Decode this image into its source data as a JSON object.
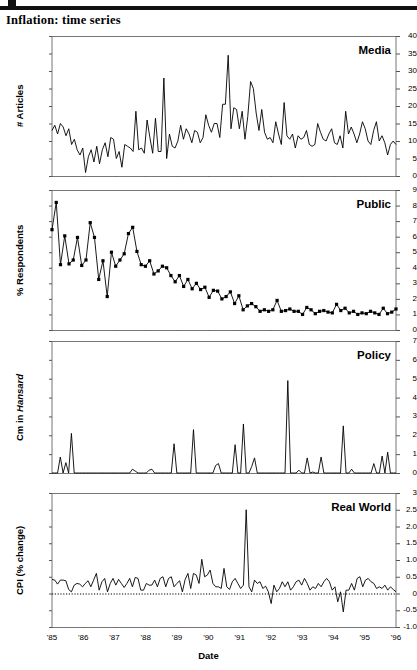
{
  "page": {
    "title": "Inflation: time series",
    "xlabel": "Date"
  },
  "chart_data": [
    {
      "id": "media",
      "type": "line",
      "title": "Media",
      "ylabel": "# Articles",
      "xlabel": "Date",
      "ylim": [
        0,
        40
      ],
      "yticks": [
        0,
        5,
        10,
        15,
        20,
        25,
        30,
        35,
        40
      ],
      "yticklabels": [
        "0",
        "5",
        "10",
        "15",
        "20",
        "25",
        "30",
        "35",
        "40"
      ],
      "xlim": [
        "'85",
        "'96"
      ],
      "xticklabels": [
        "'85",
        "'86",
        "'87",
        "'88",
        "'89",
        "'90",
        "'91",
        "'92",
        "'93",
        "'94",
        "'95",
        "'96"
      ],
      "grid": false,
      "marker": "none",
      "values": [
        13,
        14.5,
        12,
        15,
        14,
        11.5,
        13.5,
        9,
        10.5,
        7.5,
        6,
        8,
        1,
        5.5,
        7.5,
        4,
        8.5,
        3.5,
        7.5,
        9.5,
        5.5,
        11,
        10.5,
        5,
        7,
        2.5,
        9,
        8.5,
        8,
        7,
        18.5,
        7.5,
        8,
        6.5,
        16,
        11,
        6.5,
        16.5,
        7,
        7,
        28,
        5,
        12,
        8.5,
        8,
        10,
        14.5,
        10.5,
        13.5,
        12,
        9.5,
        13,
        12.5,
        9.5,
        11,
        17.5,
        14.5,
        12.5,
        15,
        15,
        11,
        20.5,
        20.5,
        34.5,
        13.5,
        19.5,
        19,
        13.5,
        18.5,
        10.5,
        17,
        27,
        25,
        18,
        13,
        19,
        12.5,
        10.5,
        11,
        9.5,
        15.5,
        12,
        9,
        21,
        11.5,
        10.5,
        12,
        8,
        11.5,
        10.5,
        11,
        13,
        9,
        8.5,
        9,
        15,
        12.5,
        10.5,
        10,
        12,
        13.5,
        9.5,
        9,
        11.5,
        8,
        18.5,
        12,
        14,
        12,
        9.5,
        12,
        15.5,
        13.5,
        10,
        9,
        13,
        15.5,
        10,
        11.5,
        9.5,
        6,
        9,
        10,
        9
      ]
    },
    {
      "id": "public",
      "type": "line",
      "title": "Public",
      "ylabel": "% Respondents",
      "xlabel": "Date",
      "ylim": [
        0,
        9
      ],
      "yticks": [
        0,
        1,
        2,
        3,
        4,
        5,
        6,
        7,
        8,
        9
      ],
      "yticklabels": [
        "0",
        "1",
        "2",
        "3",
        "4",
        "5",
        "6",
        "7",
        "8",
        "9"
      ],
      "xlim": [
        "'85",
        "'96"
      ],
      "xticklabels": [
        "'85",
        "'86",
        "'87",
        "'88",
        "'89",
        "'90",
        "'91",
        "'92",
        "'93",
        "'94",
        "'95",
        "'96"
      ],
      "grid": false,
      "marker": "square",
      "values": [
        6.45,
        8.2,
        4.2,
        6.05,
        4.25,
        4.5,
        5.95,
        4.15,
        4.5,
        6.9,
        5.95,
        3.25,
        4.45,
        2.15,
        5.0,
        4.1,
        4.5,
        4.9,
        6.2,
        6.6,
        5.05,
        4.2,
        4.1,
        4.45,
        3.6,
        3.8,
        4.1,
        4.0,
        3.5,
        3.1,
        3.5,
        2.8,
        3.25,
        2.65,
        3.0,
        2.6,
        2.75,
        2.1,
        2.55,
        2.5,
        2.0,
        2.15,
        2.45,
        1.7,
        2.2,
        1.3,
        1.55,
        1.7,
        1.5,
        1.2,
        1.3,
        1.2,
        1.3,
        1.9,
        1.2,
        1.25,
        1.35,
        1.2,
        1.2,
        1.0,
        1.45,
        1.3,
        1.05,
        1.2,
        1.25,
        1.15,
        1.1,
        1.65,
        1.25,
        1.4,
        1.1,
        1.2,
        1.0,
        1.1,
        1.05,
        1.2,
        1.1,
        1.0,
        1.4,
        1.05,
        1.15,
        1.35
      ]
    },
    {
      "id": "policy",
      "type": "line",
      "title": "Policy",
      "ylabel": "Cm in Hansard",
      "ylabel_italic_part": "Hansard",
      "xlabel": "Date",
      "ylim": [
        0,
        7
      ],
      "yticks": [
        0,
        1,
        2,
        3,
        4,
        5,
        6,
        7
      ],
      "yticklabels": [
        "0",
        "1",
        "2",
        "3",
        "4",
        "5",
        "6",
        "7"
      ],
      "xlim": [
        "'85",
        "'96"
      ],
      "xticklabels": [
        "'85",
        "'86",
        "'87",
        "'88",
        "'89",
        "'90",
        "'91",
        "'92",
        "'93",
        "'94",
        "'95",
        "'96"
      ],
      "grid": false,
      "marker": "none",
      "values": [
        0,
        0,
        0,
        0.85,
        0,
        0.55,
        0,
        2.1,
        0,
        0,
        0,
        0,
        0,
        0,
        0,
        0,
        0,
        0,
        0,
        0,
        0,
        0,
        0,
        0,
        0,
        0,
        0,
        0,
        0,
        0.2,
        0.1,
        0,
        0,
        0,
        0,
        0.15,
        0.2,
        0,
        0,
        0,
        0,
        0,
        0,
        0,
        1.55,
        0,
        0,
        0,
        0,
        0,
        0,
        2.3,
        0,
        0,
        0,
        0,
        0,
        0,
        0,
        0.4,
        0.5,
        0,
        0,
        0,
        0,
        0,
        1.5,
        0,
        0,
        2.6,
        0,
        0,
        0.35,
        0.8,
        0,
        0,
        0,
        0,
        0,
        0,
        0,
        0,
        0,
        0,
        0,
        4.9,
        0,
        0,
        0,
        0.15,
        0,
        0,
        0.8,
        0,
        0.05,
        0,
        0,
        0.85,
        0,
        0,
        0,
        0,
        0,
        0,
        0,
        2.5,
        0,
        0,
        0.2,
        0,
        0,
        0,
        0,
        0,
        0,
        0,
        0.5,
        0,
        0,
        0.9,
        0,
        1.1,
        0,
        0,
        0
      ]
    },
    {
      "id": "realworld",
      "type": "line",
      "title": "Real World",
      "ylabel": "CPI (% change)",
      "xlabel": "Date",
      "ylim": [
        -1.0,
        3.0
      ],
      "yticks": [
        -1.0,
        -0.5,
        0,
        0.5,
        1.0,
        1.5,
        2.0,
        2.5,
        3.0
      ],
      "yticklabels": [
        "-1.0",
        "-0.5",
        "0",
        "0.5",
        "1.0",
        "1.5",
        "2.0",
        "2.5",
        "3"
      ],
      "zeroline": 0,
      "xlim": [
        "'85",
        "'96"
      ],
      "xticklabels": [
        "'85",
        "'86",
        "'87",
        "'88",
        "'89",
        "'90",
        "'91",
        "'92",
        "'93",
        "'94",
        "'95",
        "'96"
      ],
      "grid": false,
      "marker": "none",
      "values": [
        0.42,
        0.4,
        0.28,
        0.4,
        0.4,
        0.38,
        0.12,
        0.05,
        0.25,
        0.3,
        0.28,
        0.2,
        0.3,
        0.38,
        0.2,
        0.4,
        0.6,
        0.1,
        0.35,
        0.45,
        0.05,
        0.3,
        0.45,
        0.25,
        0.42,
        0.3,
        0.18,
        0.3,
        0.45,
        0.2,
        0.48,
        0.45,
        0.1,
        0.1,
        0.3,
        0.25,
        0.25,
        0.4,
        0.2,
        0.45,
        0.5,
        0.2,
        0.45,
        0.5,
        0.2,
        0.3,
        0.38,
        0.05,
        0.42,
        0.6,
        0.15,
        0.6,
        0.55,
        0.3,
        1.02,
        0.5,
        0.55,
        0.7,
        0.3,
        0.2,
        0.2,
        0.15,
        0.75,
        0.2,
        0.12,
        0.35,
        0.45,
        0.3,
        0.15,
        0.25,
        2.5,
        0.2,
        0.05,
        0.4,
        0.3,
        0.35,
        0.15,
        0.22,
        0.05,
        -0.3,
        0.25,
        0.05,
        0.15,
        0.35,
        0.2,
        0.35,
        0.1,
        0.2,
        0.35,
        0.4,
        0.25,
        0.45,
        0.3,
        0.1,
        0.2,
        0.15,
        0.3,
        0.2,
        0.35,
        0.45,
        0.35,
        0.1,
        0.2,
        -0.25,
        0.05,
        -0.55,
        0.1,
        0.1,
        0.3,
        0.1,
        0.45,
        0.5,
        0.2,
        0.4,
        0.45,
        0.35,
        0.3,
        0.15,
        0.2,
        0.15,
        0.25,
        0.1,
        0.2,
        0.12,
        0.05
      ]
    }
  ]
}
